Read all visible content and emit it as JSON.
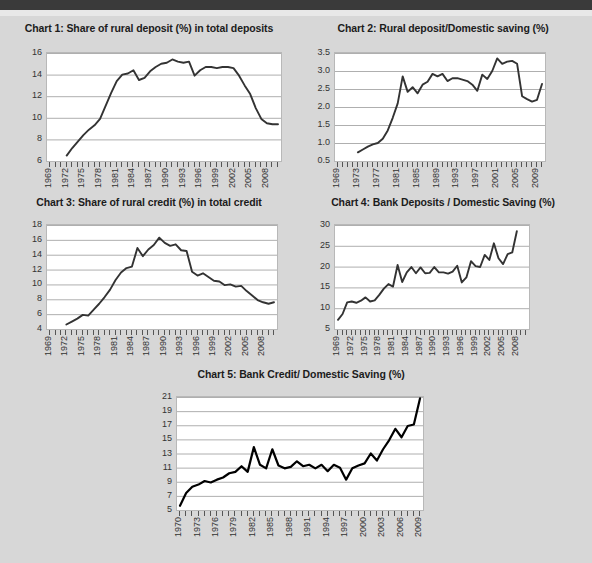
{
  "page": {
    "background_color": "#d7d7d7",
    "topbar_color": "#3a3a3a"
  },
  "charts": [
    {
      "id": "chart-1",
      "title": "Chart 1: Share of rural deposit (%) in total deposits",
      "chart_data": {
        "type": "line",
        "title": "Chart 1: Share of rural deposit (%) in total deposits",
        "xlabel": "",
        "ylabel": "",
        "ylim": [
          6,
          16
        ],
        "yticks": [
          6,
          8,
          10,
          12,
          14,
          16
        ],
        "grid": true,
        "legend": "none",
        "xlim": [
          1969,
          2010
        ],
        "xtick_labels": [
          "1969",
          "1972",
          "1975",
          "1978",
          "1981",
          "1984",
          "1987",
          "1990",
          "1993",
          "1996",
          "1999",
          "2002",
          "2005",
          "2008"
        ],
        "x": [
          1969,
          1970,
          1971,
          1972,
          1973,
          1974,
          1975,
          1976,
          1977,
          1978,
          1979,
          1980,
          1981,
          1982,
          1983,
          1984,
          1985,
          1986,
          1987,
          1988,
          1989,
          1990,
          1991,
          1992,
          1993,
          1994,
          1995,
          1996,
          1997,
          1998,
          1999,
          2000,
          2001,
          2002,
          2003,
          2004,
          2005,
          2006,
          2007,
          2008,
          2009,
          2010
        ],
        "values": [
          null,
          null,
          null,
          6.5,
          7.2,
          7.8,
          8.4,
          8.9,
          9.3,
          9.9,
          11.1,
          12.3,
          13.4,
          14.0,
          14.1,
          14.4,
          13.5,
          13.7,
          14.3,
          14.7,
          15.0,
          15.1,
          15.4,
          15.2,
          15.1,
          15.2,
          13.9,
          14.4,
          14.7,
          14.7,
          14.6,
          14.7,
          14.7,
          14.6,
          13.9,
          13.0,
          12.2,
          10.9,
          9.9,
          9.5,
          9.4,
          9.4
        ]
      }
    },
    {
      "id": "chart-2",
      "title": "Chart 2: Rural deposit/Domestic saving (%)",
      "chart_data": {
        "type": "line",
        "title": "Chart 2: Rural deposit/Domestic saving (%)",
        "xlabel": "",
        "ylabel": "",
        "ylim": [
          0.5,
          3.5
        ],
        "yticks": [
          0.5,
          1.0,
          1.5,
          2.0,
          2.5,
          3.0,
          3.5
        ],
        "ytick_labels": [
          "0.5",
          "1.0",
          "1.5",
          "2.0",
          "2.5",
          "3.0",
          "3.5"
        ],
        "grid": true,
        "legend": "none",
        "xlim": [
          1969,
          2010
        ],
        "xtick_labels": [
          "1969",
          "1973",
          "1977",
          "1981",
          "1985",
          "1989",
          "1993",
          "1997",
          "2001",
          "2005",
          "2009"
        ],
        "x": [
          1969,
          1970,
          1971,
          1972,
          1973,
          1974,
          1975,
          1976,
          1977,
          1978,
          1979,
          1980,
          1981,
          1982,
          1983,
          1984,
          1985,
          1986,
          1987,
          1988,
          1989,
          1990,
          1991,
          1992,
          1993,
          1994,
          1995,
          1996,
          1997,
          1998,
          1999,
          2000,
          2001,
          2002,
          2003,
          2004,
          2005,
          2006,
          2007,
          2008,
          2009,
          2010
        ],
        "values": [
          null,
          null,
          null,
          null,
          0.74,
          0.82,
          0.9,
          0.96,
          1.0,
          1.12,
          1.35,
          1.7,
          2.1,
          2.85,
          2.42,
          2.55,
          2.38,
          2.62,
          2.7,
          2.92,
          2.85,
          2.92,
          2.72,
          2.8,
          2.8,
          2.76,
          2.72,
          2.62,
          2.45,
          2.9,
          2.78,
          3.0,
          3.35,
          3.2,
          3.26,
          3.28,
          3.2,
          2.3,
          2.22,
          2.15,
          2.2,
          2.64
        ]
      }
    },
    {
      "id": "chart-3",
      "title": "Chart 3: Share of rural credit (%) in total credit",
      "chart_data": {
        "type": "line",
        "title": "Chart 3: Share of rural credit (%) in total credit",
        "xlabel": "",
        "ylabel": "",
        "ylim": [
          4,
          18
        ],
        "yticks": [
          4,
          6,
          8,
          10,
          12,
          14,
          16,
          18
        ],
        "grid": true,
        "legend": "none",
        "xlim": [
          1969,
          2010
        ],
        "xtick_labels": [
          "1969",
          "1972",
          "1975",
          "1978",
          "1981",
          "1984",
          "1987",
          "1990",
          "1993",
          "1996",
          "1999",
          "2002",
          "2005",
          "2008"
        ],
        "x": [
          1969,
          1970,
          1971,
          1972,
          1973,
          1974,
          1975,
          1976,
          1977,
          1978,
          1979,
          1980,
          1981,
          1982,
          1983,
          1984,
          1985,
          1986,
          1987,
          1988,
          1989,
          1990,
          1991,
          1992,
          1993,
          1994,
          1995,
          1996,
          1997,
          1998,
          1999,
          2000,
          2001,
          2002,
          2003,
          2004,
          2005,
          2006,
          2007,
          2008,
          2009,
          2010
        ],
        "values": [
          null,
          null,
          null,
          4.6,
          5.0,
          5.4,
          5.9,
          5.8,
          6.6,
          7.4,
          8.3,
          9.3,
          10.6,
          11.6,
          12.2,
          12.4,
          14.9,
          13.8,
          14.7,
          15.3,
          16.3,
          15.6,
          15.2,
          15.4,
          14.6,
          14.5,
          11.7,
          11.2,
          11.5,
          11.0,
          10.5,
          10.4,
          9.9,
          10.0,
          9.7,
          9.8,
          9.1,
          8.5,
          7.9,
          7.6,
          7.4,
          7.6
        ]
      }
    },
    {
      "id": "chart-4",
      "title": "Chart 4: Bank Deposits / Domestic Saving (%)",
      "chart_data": {
        "type": "line",
        "title": "Chart 4: Bank Deposits / Domestic Saving (%)",
        "xlabel": "",
        "ylabel": "",
        "ylim": [
          5,
          30
        ],
        "yticks": [
          5,
          10,
          15,
          20,
          25,
          30
        ],
        "grid": true,
        "legend": "none",
        "xlim": [
          1969,
          2010
        ],
        "xtick_labels": [
          "1969",
          "1972",
          "1975",
          "1978",
          "1981",
          "1984",
          "1987",
          "1990",
          "1993",
          "1996",
          "1999",
          "2002",
          "2005",
          "2008"
        ],
        "x": [
          1969,
          1970,
          1971,
          1972,
          1973,
          1974,
          1975,
          1976,
          1977,
          1978,
          1979,
          1980,
          1981,
          1982,
          1983,
          1984,
          1985,
          1986,
          1987,
          1988,
          1989,
          1990,
          1991,
          1992,
          1993,
          1994,
          1995,
          1996,
          1997,
          1998,
          1999,
          2000,
          2001,
          2002,
          2003,
          2004,
          2005,
          2006,
          2007,
          2008,
          2009,
          2010
        ],
        "values": [
          7.2,
          8.6,
          11.4,
          11.6,
          11.3,
          11.8,
          12.6,
          11.6,
          11.9,
          13.2,
          14.7,
          15.8,
          15.2,
          20.4,
          16.3,
          18.6,
          19.9,
          18.4,
          19.8,
          18.4,
          18.5,
          19.9,
          18.6,
          18.6,
          18.3,
          18.8,
          20.2,
          16.2,
          17.4,
          21.3,
          20.1,
          19.9,
          22.8,
          21.6,
          25.6,
          22.0,
          20.6,
          23.0,
          23.4,
          28.5,
          null,
          null
        ]
      }
    },
    {
      "id": "chart-5",
      "title": "Chart 5: Bank Credit/ Domestic Saving (%)",
      "chart_data": {
        "type": "line",
        "title": "Chart 5: Bank Credit/ Domestic Saving (%)",
        "xlabel": "",
        "ylabel": "",
        "ylim": [
          5,
          21
        ],
        "yticks": [
          5,
          7,
          9,
          11,
          13,
          15,
          17,
          19,
          21
        ],
        "grid": true,
        "legend": "none",
        "xlim": [
          1970,
          2009
        ],
        "xtick_labels": [
          "1970",
          "1973",
          "1976",
          "1979",
          "1982",
          "1985",
          "1988",
          "1991",
          "1994",
          "1997",
          "2000",
          "2003",
          "2006",
          "2009"
        ],
        "x": [
          1970,
          1971,
          1972,
          1973,
          1974,
          1975,
          1976,
          1977,
          1978,
          1979,
          1980,
          1981,
          1982,
          1983,
          1984,
          1985,
          1986,
          1987,
          1988,
          1989,
          1990,
          1991,
          1992,
          1993,
          1994,
          1995,
          1996,
          1997,
          1998,
          1999,
          2000,
          2001,
          2002,
          2003,
          2004,
          2005,
          2006,
          2007,
          2008,
          2009
        ],
        "values": [
          5.6,
          7.4,
          8.3,
          8.6,
          9.1,
          8.9,
          9.3,
          9.6,
          10.2,
          10.4,
          11.2,
          10.4,
          13.9,
          11.4,
          10.9,
          13.6,
          11.3,
          10.9,
          11.1,
          11.9,
          11.2,
          11.4,
          10.9,
          11.4,
          10.5,
          11.4,
          11.0,
          9.3,
          10.9,
          11.3,
          11.6,
          13.0,
          12.0,
          13.6,
          14.9,
          16.5,
          15.3,
          16.9,
          17.1,
          20.8
        ]
      }
    }
  ]
}
